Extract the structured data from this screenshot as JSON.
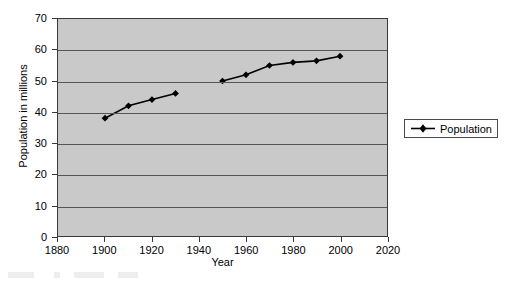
{
  "chart_data": {
    "type": "line",
    "title": "",
    "xlabel": "Year",
    "ylabel": "Population in millions",
    "xlim": [
      1880,
      2020
    ],
    "ylim": [
      0,
      70
    ],
    "xticks": [
      1880,
      1900,
      1920,
      1940,
      1960,
      1980,
      2000,
      2020
    ],
    "yticks": [
      0,
      10,
      20,
      30,
      40,
      50,
      60,
      70
    ],
    "grid": "horizontal",
    "legend_position": "right",
    "plot_background": "#c9c9c9",
    "series_color": "#000000",
    "marker": "diamond",
    "series": [
      {
        "name": "Population",
        "segments": [
          {
            "x": [
              1900,
              1910,
              1920,
              1930
            ],
            "y": [
              38,
              42,
              44,
              46
            ]
          },
          {
            "x": [
              1950,
              1960,
              1970,
              1980,
              1990,
              2000
            ],
            "y": [
              50,
              52,
              55,
              56,
              56.5,
              58
            ]
          }
        ]
      }
    ]
  },
  "axes": {
    "y_title": "Population in millions",
    "x_title": "Year",
    "y_tick_labels": [
      "0",
      "10",
      "20",
      "30",
      "40",
      "50",
      "60",
      "70"
    ],
    "x_tick_labels": [
      "1880",
      "1900",
      "1920",
      "1940",
      "1960",
      "1980",
      "2000",
      "2020"
    ]
  },
  "legend": {
    "entries": [
      {
        "label": "Population",
        "marker": "diamond-marker",
        "color": "#000000"
      }
    ]
  }
}
